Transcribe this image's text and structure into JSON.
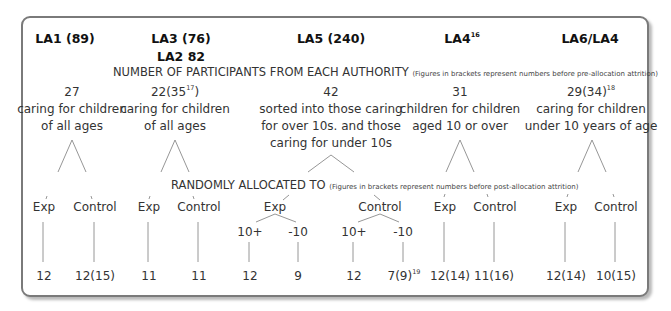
{
  "authorities": [
    {
      "id": "la1",
      "label": "LA1 (89)"
    },
    {
      "id": "la3",
      "label": "LA3 (76)",
      "sub_label": "LA2 82"
    },
    {
      "id": "la5",
      "label": "LA5 (240)"
    },
    {
      "id": "la4",
      "label": "LA4",
      "sup": "16"
    },
    {
      "id": "la6",
      "label": "LA6/LA4"
    }
  ],
  "participants_caption": {
    "main": "NUMBER OF PARTICIPANTS FROM EACH AUTHORITY",
    "note": "(Figures in brackets represent numbers before pre-allocation attrition)"
  },
  "participants": [
    {
      "count": "27",
      "desc": [
        "caring for children",
        "of all ages"
      ]
    },
    {
      "count": "22(35",
      "count_sup": "17",
      "count_tail": ")",
      "desc": [
        "caring for children",
        "of all ages"
      ]
    },
    {
      "count": "42",
      "desc": [
        "sorted into those caring",
        "for over 10s. and those",
        "caring for under 10s"
      ]
    },
    {
      "count": "31",
      "desc": [
        "children for children",
        "aged 10 or over"
      ]
    },
    {
      "count": "29(34)",
      "count_sup": "18",
      "desc": [
        "caring for children",
        "under 10 years of age"
      ]
    }
  ],
  "allocation_caption": {
    "main": "RANDOMLY ALLOCATED TO",
    "note": "(Figures in brackets represent numbers before post-allocation attrition)"
  },
  "groups": {
    "exp": "Exp",
    "control": "Control",
    "over10": "10+",
    "under10": "-10"
  },
  "results": {
    "la1": {
      "exp": "12",
      "control": "12(15)"
    },
    "la3": {
      "exp": "11",
      "control": "11"
    },
    "la5": {
      "exp": {
        "over10": "12",
        "under10": "9"
      },
      "control": {
        "over10": "12",
        "under10": "7(9)",
        "under10_sup": "19"
      }
    },
    "la4": {
      "exp": "12(14)",
      "control": "11(16)"
    },
    "la6": {
      "exp": "12(14)",
      "control": "10(15)"
    }
  },
  "colors": {
    "border": "#7a7a7a",
    "line": "#8a8a8a",
    "text": "#333333"
  }
}
